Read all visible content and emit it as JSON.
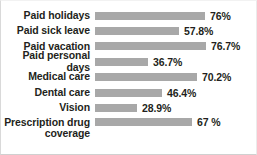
{
  "chart_data": {
    "type": "bar",
    "orientation": "horizontal",
    "title": "",
    "subtitle": "",
    "xlabel": "",
    "ylabel": "",
    "xlim": [
      0,
      80
    ],
    "grid": false,
    "legend": false,
    "bar_color": "#a8a8a8",
    "text_color": "#231f20",
    "background": "#ffffff",
    "px_per_percent": 1.45,
    "categories": [
      "Paid holidays",
      "Paid sick leave",
      "Paid vacation",
      "Paid personal days",
      "Medical care",
      "Dental care",
      "Vision",
      "Prescription drug coverage"
    ],
    "values": [
      76,
      57.8,
      76.7,
      36.7,
      70.2,
      46.4,
      28.9,
      67
    ],
    "value_labels": [
      "76%",
      "57.8%",
      "76.7%",
      "36.7%",
      "70.2%",
      "46.4%",
      "28.9%",
      "67 %"
    ]
  },
  "rows": [
    {
      "label": "Paid holidays",
      "value": 76,
      "value_label": "76%",
      "bar_width": "110px"
    },
    {
      "label": "Paid sick leave",
      "value": 57.8,
      "value_label": "57.8%",
      "bar_width": "84px"
    },
    {
      "label": "Paid vacation",
      "value": 76.7,
      "value_label": "76.7%",
      "bar_width": "111px"
    },
    {
      "label": "Paid personal days",
      "value": 36.7,
      "value_label": "36.7%",
      "bar_width": "53px"
    },
    {
      "label": "Medical care",
      "value": 70.2,
      "value_label": "70.2%",
      "bar_width": "102px"
    },
    {
      "label": "Dental care",
      "value": 46.4,
      "value_label": "46.4%",
      "bar_width": "67px"
    },
    {
      "label": "Vision",
      "value": 28.9,
      "value_label": "28.9%",
      "bar_width": "42px"
    },
    {
      "label": "Prescription drug coverage",
      "value": 67,
      "value_label": "67 %",
      "bar_width": "97px"
    }
  ]
}
